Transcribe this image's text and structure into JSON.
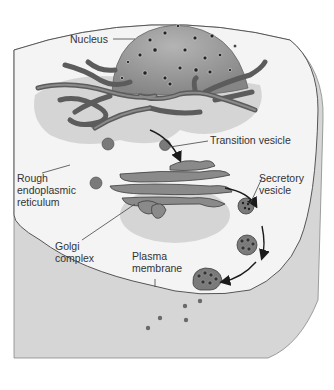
{
  "diagram": {
    "type": "cell-secretory-pathway",
    "labels": {
      "nucleus": "Nucleus",
      "transition_vesicle": "Transition vesicle",
      "rough_er": "Rough\nendoplasmic\nreticulum",
      "secretory_vesicle": "Secretory\nvesicle",
      "golgi": "Golgi\ncomplex",
      "plasma_membrane": "Plasma\nmembrane"
    },
    "colors": {
      "cytoplasm": "#f4f4f4",
      "cell_wall_shadow": "#d9d9d9",
      "nucleus": "#9a9a9a",
      "er": "#6f6f6f",
      "er_outline": "#3a3a3a",
      "golgi": "#8a8a8a",
      "vesicle": "#7a7a7a",
      "arrow": "#1a1a1a",
      "leader_line": "#444444"
    },
    "flow": [
      "Rough endoplasmic reticulum",
      "Transition vesicle",
      "Golgi complex",
      "Secretory vesicle",
      "Plasma membrane"
    ]
  }
}
